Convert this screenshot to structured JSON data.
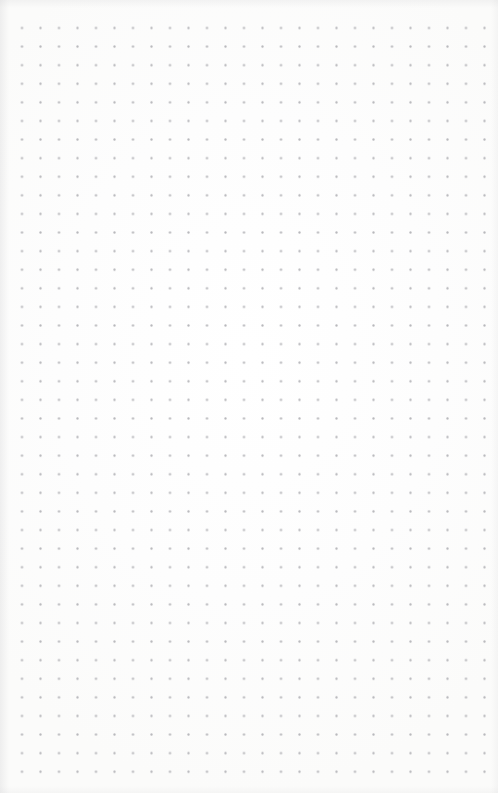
{
  "page": {
    "kind": "dot-grid-paper",
    "width": 498,
    "height": 793,
    "background_color": "#fdfdfd",
    "text_content": "",
    "note": ""
  },
  "grid": {
    "dot_color": "#b8b8bc",
    "dot_size_px": 1.5,
    "spacing_x_px": 18.5,
    "spacing_y_px": 18.6,
    "origin_x_px": 22,
    "origin_y_px": 28,
    "columns": 26,
    "rows": 41,
    "last_column_x_px": 478,
    "last_row_y_px": 775
  },
  "edges": {
    "vignette_color": "#d0d0d2",
    "left_margin_px": 22,
    "right_margin_px": 20,
    "top_margin_px": 28,
    "bottom_margin_px": 18
  }
}
